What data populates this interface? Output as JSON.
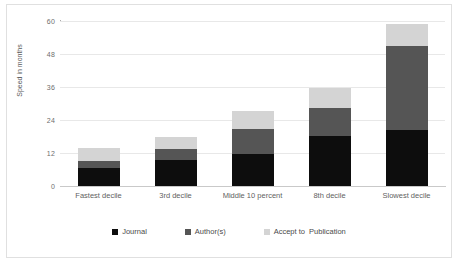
{
  "chart_data": {
    "type": "bar",
    "subtype": "stacked-vertical",
    "title": "",
    "xlabel": "",
    "ylabel": "Speed in months",
    "ylim": [
      0,
      60
    ],
    "yticks": [
      0,
      12,
      24,
      36,
      48,
      60
    ],
    "grid": true,
    "legend_position": "bottom",
    "categories": [
      "Fastest decile",
      "3rd decile",
      "Middle 10 percent",
      "8th decile",
      "Slowest decile"
    ],
    "series": [
      {
        "name": "Journal",
        "color": "#0d0d0d",
        "values": [
          6.7,
          9.3,
          11.5,
          18.3,
          20.5
        ]
      },
      {
        "name": "Author(s)",
        "color": "#555555",
        "values": [
          2.5,
          4.1,
          9.4,
          10.0,
          30.5
        ]
      },
      {
        "name": "Accept to  Publication",
        "color": "#d4d4d4",
        "values": [
          4.6,
          4.5,
          6.3,
          7.5,
          7.8
        ]
      }
    ],
    "totals": [
      13.8,
      17.9,
      27.2,
      35.8,
      58.8
    ]
  },
  "axis": {
    "y": {
      "title": "Speed in months",
      "ticks": [
        "0",
        "12",
        "24",
        "36",
        "48",
        "60"
      ]
    }
  },
  "legend": {
    "items": [
      {
        "label": "Journal",
        "color": "#0d0d0d"
      },
      {
        "label": "Author(s)",
        "color": "#555555"
      },
      {
        "label": "Accept to  Publication",
        "color": "#d4d4d4"
      }
    ]
  },
  "colors": {
    "journal": "#0d0d0d",
    "authors": "#555555",
    "accept_to_publication": "#d4d4d4",
    "gridline": "#e8e8e8",
    "axis": "#aaaaaa",
    "frame": "#e0e0e0",
    "text": "#5f5f5f"
  }
}
